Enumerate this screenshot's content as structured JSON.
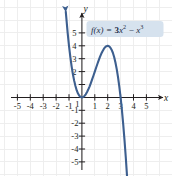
{
  "figure": {
    "name": "cubic-function-graph",
    "background_color": "#ffffff"
  },
  "equation_label": {
    "text": "f(x) = 3x² − x³",
    "f_name": "f",
    "arg": "(x)",
    "equals": "=",
    "term1_coeff": "3",
    "term1_var": "x",
    "term1_exp": "2",
    "minus": "−",
    "term2_var": "x",
    "term2_exp": "3",
    "box_color": "#d6e2ee",
    "text_color": "#1c2b45"
  },
  "axes": {
    "x_label": "x",
    "y_label": "y",
    "axis_color": "#231f20",
    "grid_color": "#ececec",
    "x_ticks": [
      "-5",
      "-4",
      "-3",
      "-2",
      "-1",
      "1",
      "2",
      "3",
      "4",
      "5"
    ],
    "y_ticks": [
      "5",
      "4",
      "3",
      "2",
      "1",
      "-1",
      "-2",
      "-3",
      "-4",
      "-5"
    ],
    "x_tick_values": [
      -5,
      -4,
      -3,
      -2,
      -1,
      1,
      2,
      3,
      4,
      5
    ],
    "y_tick_values": [
      5,
      4,
      3,
      2,
      1,
      -1,
      -2,
      -3,
      -4,
      -5
    ],
    "minus_glyph": "−"
  },
  "curve": {
    "color": "#3d5f8f",
    "width": 2.1,
    "arrow_start": true,
    "arrow_end": true
  },
  "chart_data": {
    "type": "line",
    "title": "",
    "subtitle": "",
    "xlabel": "x",
    "ylabel": "y",
    "xlim": [
      -5.8,
      5.8
    ],
    "ylim": [
      -5.8,
      5.8
    ],
    "grid": true,
    "grid_spacing": 1,
    "legend": "inline-annotation",
    "annotations": [
      {
        "text": "f(x) = 3x² − x³",
        "x": 3.1,
        "y": 5.1
      }
    ],
    "series": [
      {
        "name": "f(x) = 3x² − x³",
        "formula": "3*x^2 - x^3",
        "color": "#3d5f8f",
        "x": [
          -1.25,
          -1.1,
          -1.0,
          -0.9,
          -0.8,
          -0.7,
          -0.6,
          -0.5,
          -0.4,
          -0.3,
          -0.2,
          -0.1,
          0.0,
          0.1,
          0.2,
          0.3,
          0.4,
          0.5,
          0.6,
          0.7,
          0.8,
          0.9,
          1.0,
          1.1,
          1.2,
          1.3,
          1.4,
          1.5,
          1.6,
          1.7,
          1.8,
          1.9,
          2.0,
          2.1,
          2.2,
          2.3,
          2.4,
          2.5,
          2.6,
          2.7,
          2.8,
          2.9,
          3.0,
          3.1,
          3.2,
          3.3,
          3.4,
          3.5,
          3.6
        ],
        "y": [
          6.64,
          4.96,
          4.0,
          3.16,
          2.43,
          1.81,
          1.3,
          0.88,
          0.54,
          0.3,
          0.13,
          0.03,
          0.0,
          0.03,
          0.11,
          0.24,
          0.42,
          0.63,
          0.86,
          1.13,
          1.41,
          1.7,
          2.0,
          2.3,
          2.59,
          2.87,
          3.14,
          3.38,
          3.58,
          3.76,
          3.89,
          3.97,
          4.0,
          3.97,
          3.87,
          3.7,
          3.46,
          3.13,
          2.7,
          2.19,
          1.57,
          0.84,
          0.0,
          -0.96,
          -2.05,
          -3.27,
          -4.62,
          -6.13,
          -7.78
        ],
        "key_points": [
          {
            "label": "local minimum",
            "x": 0,
            "y": 0
          },
          {
            "label": "local maximum",
            "x": 2,
            "y": 4
          },
          {
            "label": "x-intercept",
            "x": 0,
            "y": 0
          },
          {
            "label": "x-intercept",
            "x": 3,
            "y": 0
          },
          {
            "label": "y-intercept",
            "x": 0,
            "y": 0
          }
        ]
      }
    ]
  }
}
